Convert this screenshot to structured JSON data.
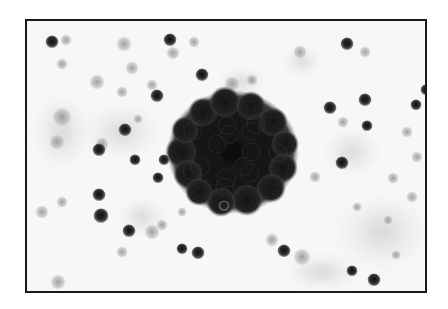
{
  "image": {
    "kind": "grayscale micrograph",
    "frame": {
      "x": 25,
      "y": 19,
      "width": 400,
      "height": 272,
      "border_color": "#1a1a1a"
    },
    "background_color": "#f7f7f7",
    "cluster": {
      "cx": 231,
      "cy": 150,
      "rx": 60,
      "ry": 56,
      "color": "#141414"
    },
    "cells_dark": [
      [
        50,
        40,
        5
      ],
      [
        168,
        38,
        5
      ],
      [
        200,
        73,
        5
      ],
      [
        155,
        94,
        5
      ],
      [
        123,
        128,
        5
      ],
      [
        97,
        148,
        5
      ],
      [
        99,
        214,
        6
      ],
      [
        127,
        229,
        5
      ],
      [
        162,
        158,
        4
      ],
      [
        156,
        176,
        4
      ],
      [
        133,
        158,
        4
      ],
      [
        345,
        42,
        5
      ],
      [
        328,
        106,
        5
      ],
      [
        414,
        103,
        4
      ],
      [
        363,
        98,
        5
      ],
      [
        340,
        161,
        5
      ],
      [
        282,
        249,
        5
      ],
      [
        350,
        269,
        4
      ],
      [
        372,
        278,
        5
      ],
      [
        222,
        204,
        4
      ],
      [
        196,
        251,
        5
      ],
      [
        97,
        193,
        5
      ],
      [
        180,
        247,
        4
      ],
      [
        424,
        88,
        4
      ],
      [
        365,
        124,
        4
      ]
    ],
    "cells_light": [
      [
        64,
        38,
        6
      ],
      [
        60,
        62,
        6
      ],
      [
        122,
        42,
        8
      ],
      [
        171,
        51,
        7
      ],
      [
        192,
        40,
        6
      ],
      [
        130,
        66,
        7
      ],
      [
        150,
        83,
        6
      ],
      [
        95,
        80,
        8
      ],
      [
        120,
        90,
        6
      ],
      [
        60,
        115,
        10
      ],
      [
        55,
        140,
        8
      ],
      [
        100,
        142,
        7
      ],
      [
        160,
        223,
        6
      ],
      [
        136,
        117,
        5
      ],
      [
        298,
        50,
        7
      ],
      [
        363,
        50,
        6
      ],
      [
        415,
        155,
        6
      ],
      [
        405,
        130,
        6
      ],
      [
        410,
        195,
        6
      ],
      [
        341,
        120,
        6
      ],
      [
        313,
        175,
        6
      ],
      [
        391,
        176,
        6
      ],
      [
        355,
        205,
        5
      ],
      [
        394,
        253,
        5
      ],
      [
        300,
        255,
        9
      ],
      [
        270,
        238,
        7
      ],
      [
        56,
        280,
        8
      ],
      [
        40,
        210,
        7
      ],
      [
        60,
        200,
        6
      ],
      [
        150,
        230,
        8
      ],
      [
        250,
        78,
        6
      ],
      [
        230,
        82,
        8
      ],
      [
        180,
        210,
        5
      ],
      [
        120,
        250,
        6
      ],
      [
        386,
        218,
        5
      ]
    ],
    "haze": [
      [
        120,
        130,
        40,
        30
      ],
      [
        380,
        230,
        50,
        40
      ],
      [
        320,
        270,
        40,
        20
      ],
      [
        60,
        130,
        30,
        40
      ],
      [
        140,
        215,
        25,
        20
      ],
      [
        240,
        80,
        25,
        15
      ],
      [
        300,
        60,
        20,
        15
      ],
      [
        350,
        150,
        30,
        25
      ]
    ]
  }
}
